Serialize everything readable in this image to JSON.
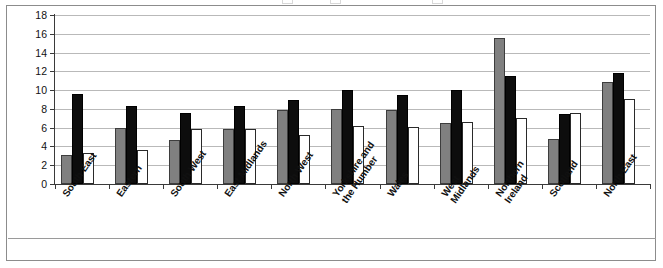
{
  "figure": {
    "clipped_legend_note": "legend row cropped at top edge"
  },
  "chart_data": {
    "type": "bar",
    "title": "",
    "subtitle": "",
    "xlabel": "",
    "ylabel": "",
    "ylim": [
      0,
      18
    ],
    "ytick_step": 2,
    "yticks": [
      0,
      2,
      4,
      6,
      8,
      10,
      12,
      14,
      16,
      18
    ],
    "ytick_labels": [
      "0",
      "2",
      "4",
      "6",
      "8",
      "10",
      "12",
      "14",
      "16",
      "18"
    ],
    "grid": true,
    "grid_axis": "y",
    "legend_position": "top (cropped)",
    "categories": [
      "South East",
      "Eastern",
      "South West",
      "East Midlands",
      "North West",
      "Yorkshire and\nthe Humber",
      "Wales",
      "West\nMidlands",
      "Northern\nIreland",
      "Scotland",
      "North East"
    ],
    "series": [
      {
        "name": "Series 1",
        "color": "#808080",
        "values": [
          3.1,
          6.0,
          4.7,
          5.9,
          7.9,
          8.0,
          7.9,
          6.5,
          15.5,
          4.8,
          10.9
        ]
      },
      {
        "name": "Series 2",
        "color": "#0d0d0d",
        "values": [
          9.6,
          8.3,
          7.6,
          8.3,
          8.9,
          10.0,
          9.5,
          10.0,
          11.5,
          7.5,
          11.8
        ]
      },
      {
        "name": "Series 3",
        "color": "#ffffff",
        "values": [
          3.35,
          3.6,
          5.9,
          5.9,
          5.2,
          6.2,
          6.1,
          6.6,
          7.0,
          7.6,
          9.1
        ]
      }
    ]
  }
}
